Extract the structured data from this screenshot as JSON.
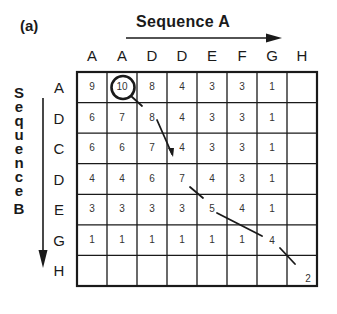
{
  "panel_label": "(a)",
  "sequence_a": {
    "title": "Sequence A",
    "letters": [
      "A",
      "A",
      "D",
      "D",
      "E",
      "F",
      "G",
      "H"
    ]
  },
  "sequence_b": {
    "title_chars": [
      "S",
      "e",
      "q",
      "u",
      "e",
      "n",
      "c",
      "e",
      "B"
    ],
    "letters": [
      "A",
      "D",
      "C",
      "D",
      "E",
      "G",
      "H"
    ]
  },
  "matrix": [
    [
      "9",
      "10",
      "8",
      "4",
      "3",
      "3",
      "1",
      ""
    ],
    [
      "6",
      "7",
      "8",
      "4",
      "3",
      "3",
      "1",
      ""
    ],
    [
      "6",
      "6",
      "7",
      "4",
      "3",
      "3",
      "1",
      ""
    ],
    [
      "4",
      "4",
      "6",
      "7",
      "4",
      "3",
      "1",
      ""
    ],
    [
      "3",
      "3",
      "3",
      "3",
      "5",
      "4",
      "1",
      ""
    ],
    [
      "1",
      "1",
      "1",
      "1",
      "1",
      "1",
      "4",
      ""
    ],
    [
      "",
      "",
      "",
      "",
      "",
      "",
      "",
      "2"
    ]
  ],
  "highlight": {
    "row": 0,
    "col": 1,
    "value": "10",
    "shape": "circle"
  },
  "traceback_path": [
    {
      "row": 0,
      "col": 1,
      "value": "10"
    },
    {
      "row": 1,
      "col": 2,
      "value": "8"
    },
    {
      "row": 3,
      "col": 3,
      "value": "7"
    },
    {
      "row": 4,
      "col": 4,
      "value": "5"
    },
    {
      "row": 5,
      "col": 6,
      "value": "4"
    },
    {
      "row": 6,
      "col": 7,
      "value": "2"
    }
  ],
  "colors": {
    "ink": "#1a1a1a",
    "background": "#ffffff"
  }
}
